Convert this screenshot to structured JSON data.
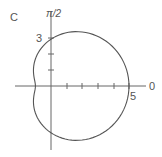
{
  "panel_label": "C",
  "chart_data": {
    "type": "line",
    "coordinate_system": "polar",
    "title": "",
    "equation": "r = 3 + 2cos(theta)",
    "curve_points_polar": [
      {
        "theta": "0",
        "r": 5
      },
      {
        "theta": "pi/2",
        "r": 3
      },
      {
        "theta": "pi",
        "r": 1
      },
      {
        "theta": "3pi/2",
        "r": 3
      }
    ],
    "axis_labels": {
      "polar_axis": "0",
      "vertical_axis": "π/2"
    },
    "tick_labels": {
      "x": "5",
      "y": "3"
    },
    "x_ticks": [
      1,
      2,
      3,
      4,
      5
    ],
    "y_ticks": [
      1,
      2,
      3
    ],
    "grid": false,
    "legend": null
  },
  "colors": {
    "axis": "#666666",
    "curve": "#555555",
    "text": "#555555"
  }
}
